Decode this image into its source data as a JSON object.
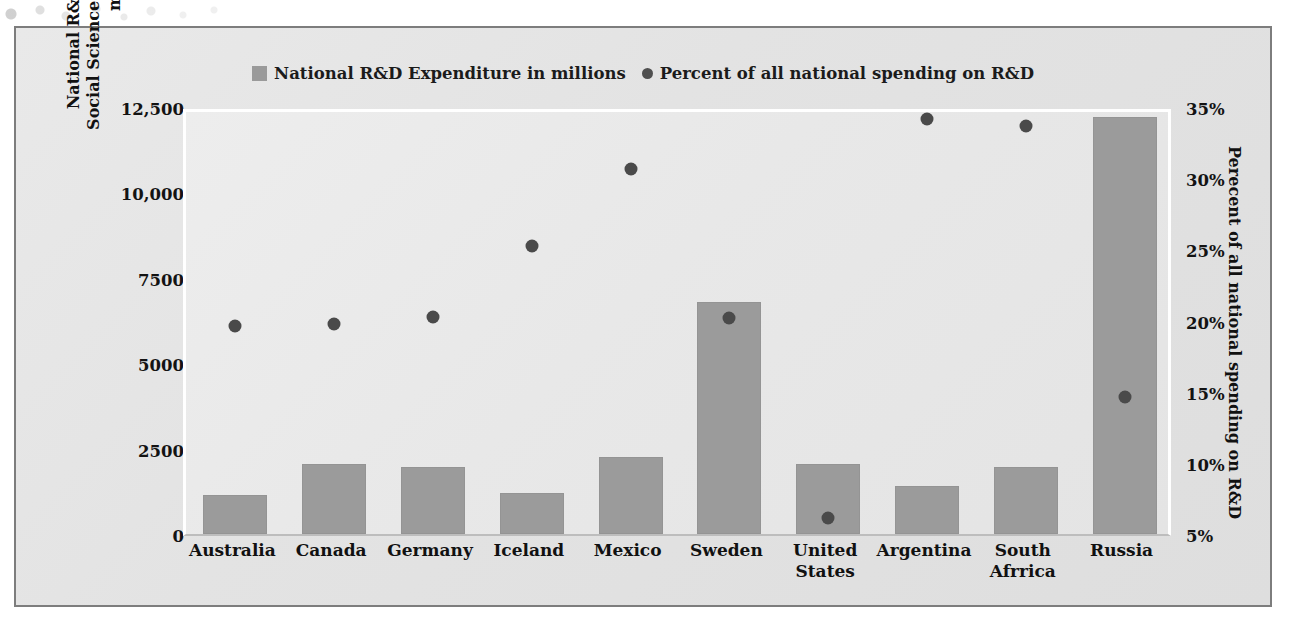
{
  "legend": {
    "items": [
      {
        "label": "National R&D Expenditure in millions",
        "marker": "square-swatch-icon",
        "color": "#9a9a9a"
      },
      {
        "label": "Percent of all national spending on R&D",
        "marker": "circle-dot-icon",
        "color": "#4f4f4f"
      }
    ]
  },
  "axes": {
    "left_title": "National R&D Expenditures on Social Sciences and Humanities (in millions)",
    "right_title": "Perecent of all national spending on R&D",
    "left_ticks": [
      "12,500",
      "10,000",
      "7500",
      "5000",
      "2500",
      "0"
    ],
    "right_ticks": [
      "35%",
      "30%",
      "25%",
      "20%",
      "15%",
      "10%",
      "5%"
    ]
  },
  "chart_data": {
    "type": "bar",
    "title": "",
    "xlabel": "",
    "ylabel": "National R&D Expenditures on Social Sciences and Humanities (in millions)",
    "y2label": "Perecent of all national spending on R&D",
    "categories": [
      "Australia",
      "Canada",
      "Germany",
      "Iceland",
      "Mexico",
      "Sweden",
      "United States",
      "Argentina",
      "South Afrrica",
      "Russia"
    ],
    "series": [
      {
        "name": "National R&D Expenditure in millions",
        "type": "bar",
        "axis": "left",
        "color": "#9b9b9b",
        "values": [
          1150,
          2050,
          1950,
          1200,
          2250,
          6800,
          2050,
          1400,
          1950,
          12200
        ]
      },
      {
        "name": "Percent of all national spending on R&D",
        "type": "scatter",
        "axis": "right",
        "color": "#4a4a4a",
        "values": [
          20.0,
          20.1,
          20.6,
          25.6,
          31.0,
          20.5,
          6.5,
          34.5,
          34.0,
          15.0
        ]
      }
    ],
    "ylim": [
      0,
      12500
    ],
    "y2lim": [
      5,
      35
    ],
    "grid": false,
    "legend_position": "top"
  }
}
